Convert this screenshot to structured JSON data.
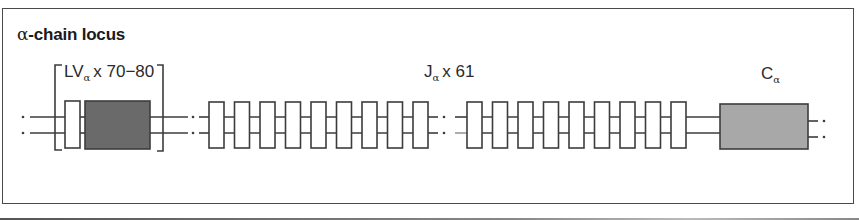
{
  "title": {
    "greek": "α",
    "text": "-chain locus"
  },
  "segments": {
    "v": {
      "main": "LV",
      "sub": "α",
      "count": "x 70−80"
    },
    "j": {
      "main": "J",
      "sub": "α",
      "count": "x 61"
    },
    "c": {
      "main": "C",
      "sub": "α"
    }
  },
  "colors": {
    "line": "#3c3c3c",
    "v_exon_fill": "#6a6a6a",
    "c_exon_fill": "#a8a8a8",
    "leader_fill": "#ffffff",
    "j_fill": "#ffffff"
  },
  "layout": {
    "strand_y": [
      117,
      133
    ],
    "j_boxes_left_x": [
      209,
      234.5,
      260,
      285.5,
      311,
      336.5,
      362,
      387.5,
      413
    ],
    "j_boxes_right_x": [
      467,
      492.5,
      518,
      543.5,
      569,
      594.5,
      620,
      645.5,
      671
    ],
    "j_box": {
      "width": 15,
      "top": 102,
      "height": 46
    }
  }
}
